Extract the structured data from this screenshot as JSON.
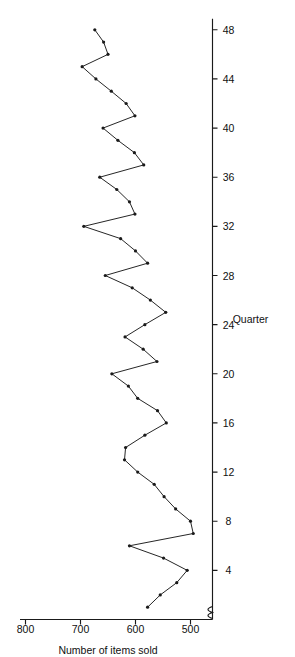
{
  "figure": {
    "orientation_label": "rotated-90-ccw",
    "background_color": "#ffffff",
    "ink_color": "#1a1a1a"
  },
  "chart_data": {
    "type": "line",
    "title": "",
    "subtitle": "",
    "xlabel": "Quarter",
    "ylabel": "Number of items sold",
    "xlim": [
      0,
      49
    ],
    "ylim": [
      460,
      820
    ],
    "xticks": [
      4,
      8,
      12,
      16,
      20,
      24,
      28,
      32,
      36,
      40,
      44,
      48
    ],
    "xtick_labels": [
      "4",
      "8",
      "12",
      "16",
      "20",
      "24",
      "28",
      "32",
      "36",
      "40",
      "44",
      "48"
    ],
    "yticks": [
      500,
      600,
      700,
      800
    ],
    "ytick_labels": [
      "500",
      "600",
      "700",
      "800"
    ],
    "grid": false,
    "legend": null,
    "legend_position": "none",
    "markers": "filled-circle",
    "axis_break": true,
    "annotations": [],
    "x": [
      1,
      2,
      3,
      4,
      5,
      6,
      7,
      8,
      9,
      10,
      11,
      12,
      13,
      14,
      15,
      16,
      17,
      18,
      19,
      20,
      21,
      22,
      23,
      24,
      25,
      26,
      27,
      28,
      29,
      30,
      31,
      32,
      33,
      34,
      35,
      36,
      37,
      38,
      39,
      40,
      41,
      42,
      43,
      44,
      45,
      46,
      47,
      48
    ],
    "series": [
      {
        "name": "Items sold",
        "values": [
          578,
          555,
          525,
          506,
          549,
          611,
          495,
          500,
          527,
          548,
          566,
          596,
          620,
          618,
          583,
          544,
          560,
          596,
          613,
          643,
          561,
          586,
          619,
          583,
          545,
          573,
          606,
          655,
          578,
          600,
          627,
          694,
          601,
          611,
          634,
          665,
          585,
          602,
          632,
          659,
          601,
          617,
          644,
          672,
          697,
          650,
          658,
          674
        ]
      }
    ],
    "values": [
      578,
      555,
      525,
      506,
      549,
      611,
      495,
      500,
      527,
      548,
      566,
      596,
      620,
      618,
      583,
      544,
      560,
      596,
      613,
      643,
      561,
      586,
      619,
      583,
      545,
      573,
      606,
      655,
      578,
      600,
      627,
      694,
      601,
      611,
      634,
      665,
      585,
      602,
      632,
      659,
      601,
      617,
      644,
      672,
      697,
      650,
      658,
      674
    ]
  }
}
